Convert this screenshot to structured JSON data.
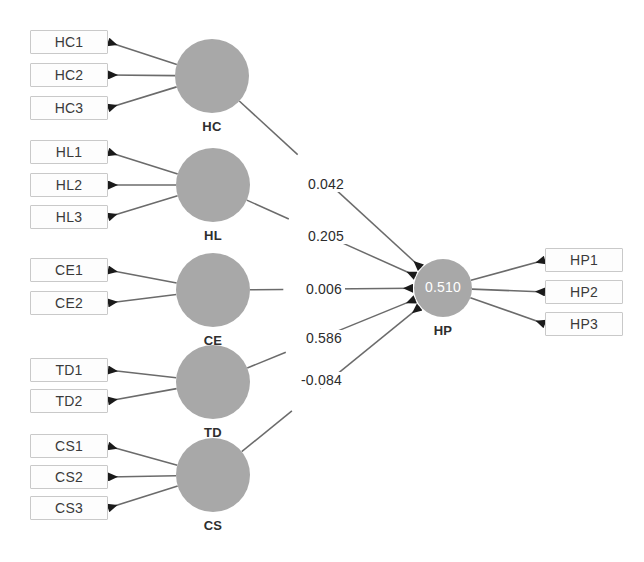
{
  "diagram": {
    "type": "sem-path-diagram",
    "title": "",
    "colors": {
      "construct_fill": "#a8a8a8",
      "indicator_border": "#c9c9c9",
      "indicator_fill": "#fdfdfd",
      "arrow": "#6b6b6b",
      "arrowhead": "#1a1a1a",
      "r2_text": "#ffffff",
      "label_text": "#2e2e2e",
      "background": "#ffffff"
    },
    "constructs": [
      {
        "id": "HC",
        "label": "HC",
        "cx": 212,
        "cy": 76,
        "r": 37,
        "role": "exogenous",
        "r2": null
      },
      {
        "id": "HL",
        "label": "HL",
        "cx": 213,
        "cy": 185,
        "r": 37,
        "role": "exogenous",
        "r2": null
      },
      {
        "id": "CE",
        "label": "CE",
        "cx": 213,
        "cy": 290,
        "r": 37,
        "role": "exogenous",
        "r2": null
      },
      {
        "id": "TD",
        "label": "TD",
        "cx": 213,
        "cy": 382,
        "r": 37,
        "role": "exogenous",
        "r2": null
      },
      {
        "id": "CS",
        "label": "CS",
        "cx": 213,
        "cy": 475,
        "r": 37,
        "role": "exogenous",
        "r2": null
      },
      {
        "id": "HP",
        "label": "HP",
        "cx": 443,
        "cy": 288,
        "r": 29,
        "role": "endogenous",
        "r2": "0.510"
      }
    ],
    "indicators": [
      {
        "id": "HC1",
        "label": "HC1",
        "x": 30,
        "y": 30,
        "w": 78,
        "h": 24,
        "construct": "HC",
        "side": "left"
      },
      {
        "id": "HC2",
        "label": "HC2",
        "x": 30,
        "y": 63,
        "w": 78,
        "h": 24,
        "construct": "HC",
        "side": "left"
      },
      {
        "id": "HC3",
        "label": "HC3",
        "x": 30,
        "y": 96,
        "w": 78,
        "h": 24,
        "construct": "HC",
        "side": "left"
      },
      {
        "id": "HL1",
        "label": "HL1",
        "x": 30,
        "y": 140,
        "w": 78,
        "h": 24,
        "construct": "HL",
        "side": "left"
      },
      {
        "id": "HL2",
        "label": "HL2",
        "x": 30,
        "y": 173,
        "w": 78,
        "h": 24,
        "construct": "HL",
        "side": "left"
      },
      {
        "id": "HL3",
        "label": "HL3",
        "x": 30,
        "y": 205,
        "w": 78,
        "h": 24,
        "construct": "HL",
        "side": "left"
      },
      {
        "id": "CE1",
        "label": "CE1",
        "x": 30,
        "y": 258,
        "w": 78,
        "h": 24,
        "construct": "CE",
        "side": "left"
      },
      {
        "id": "CE2",
        "label": "CE2",
        "x": 30,
        "y": 291,
        "w": 78,
        "h": 24,
        "construct": "CE",
        "side": "left"
      },
      {
        "id": "TD1",
        "label": "TD1",
        "x": 30,
        "y": 358,
        "w": 78,
        "h": 24,
        "construct": "TD",
        "side": "left"
      },
      {
        "id": "TD2",
        "label": "TD2",
        "x": 30,
        "y": 389,
        "w": 78,
        "h": 24,
        "construct": "TD",
        "side": "left"
      },
      {
        "id": "CS1",
        "label": "CS1",
        "x": 30,
        "y": 434,
        "w": 78,
        "h": 24,
        "construct": "CS",
        "side": "left"
      },
      {
        "id": "CS2",
        "label": "CS2",
        "x": 30,
        "y": 465,
        "w": 78,
        "h": 24,
        "construct": "CS",
        "side": "left"
      },
      {
        "id": "CS3",
        "label": "CS3",
        "x": 30,
        "y": 496,
        "w": 78,
        "h": 24,
        "construct": "CS",
        "side": "left"
      },
      {
        "id": "HP1",
        "label": "HP1",
        "x": 545,
        "y": 248,
        "w": 78,
        "h": 24,
        "construct": "HP",
        "side": "right"
      },
      {
        "id": "HP2",
        "label": "HP2",
        "x": 545,
        "y": 280,
        "w": 78,
        "h": 24,
        "construct": "HP",
        "side": "right"
      },
      {
        "id": "HP3",
        "label": "HP3",
        "x": 545,
        "y": 312,
        "w": 78,
        "h": 24,
        "construct": "HP",
        "side": "right"
      }
    ],
    "structural_paths": [
      {
        "from": "HC",
        "to": "HP",
        "coefficient": "0.042",
        "label_x": 305,
        "label_y": 176
      },
      {
        "from": "HL",
        "to": "HP",
        "coefficient": "0.205",
        "label_x": 305,
        "label_y": 228
      },
      {
        "from": "CE",
        "to": "HP",
        "coefficient": "0.006",
        "label_x": 303,
        "label_y": 281
      },
      {
        "from": "TD",
        "to": "HP",
        "coefficient": "0.586",
        "label_x": 303,
        "label_y": 330
      },
      {
        "from": "CS",
        "to": "HP",
        "coefficient": "-0.084",
        "label_x": 298,
        "label_y": 372
      }
    ]
  }
}
